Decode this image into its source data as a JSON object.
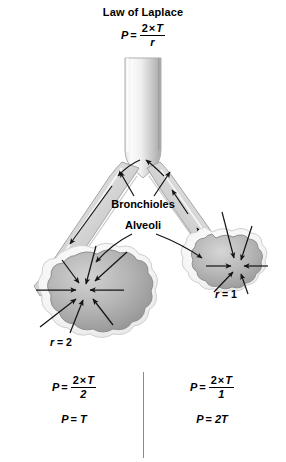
{
  "title": {
    "heading": "Law of Laplace",
    "formula": {
      "lhs": "P",
      "eq": "=",
      "numerator_a": "2",
      "times": "×",
      "numerator_b": "T",
      "denominator": "r"
    }
  },
  "diagram": {
    "labels": {
      "bronchioles": "Bronchioles",
      "alveoli": "Alveoli"
    },
    "left_alveolus": {
      "radius_symbol": "r",
      "radius_eq": "=",
      "radius_value": "2"
    },
    "right_alveolus": {
      "radius_symbol": "r",
      "radius_eq": "=",
      "radius_value": "1"
    },
    "colors": {
      "tissue_light": "#f2f2f2",
      "tissue_mid": "#b9b9b9",
      "tissue_dark": "#8e8e8e",
      "outline": "#9a9a9a",
      "arrow": "#1a1a1a",
      "background": "#ffffff"
    }
  },
  "comparison": {
    "left": {
      "pressure_formula": {
        "lhs": "P",
        "eq": "=",
        "numerator_a": "2",
        "times": "×",
        "numerator_b": "T",
        "denominator": "2"
      },
      "result": {
        "lhs": "P",
        "eq": "=",
        "value": "T"
      }
    },
    "right": {
      "pressure_formula": {
        "lhs": "P",
        "eq": "=",
        "numerator_a": "2",
        "times": "×",
        "numerator_b": "T",
        "denominator": "1"
      },
      "result": {
        "lhs": "P",
        "eq": "=",
        "value": "2T"
      }
    }
  }
}
